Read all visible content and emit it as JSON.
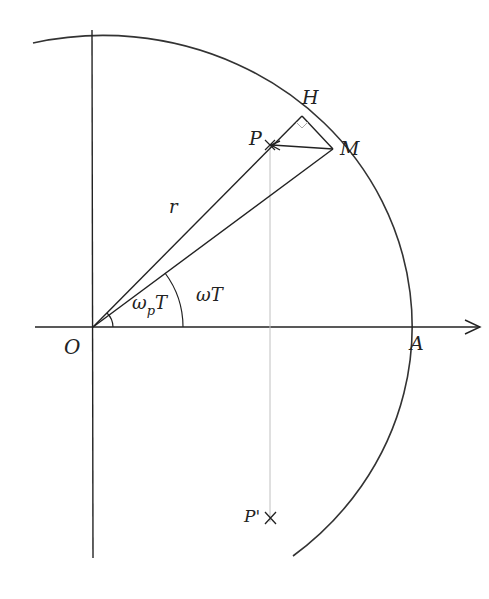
{
  "diagram": {
    "title": "",
    "colors": {
      "stroke": "#2a2a2a",
      "projection": "#bdbdbd",
      "background": "#ffffff"
    },
    "labels": {
      "origin": "O",
      "axis_point": "A",
      "point_p": "P",
      "point_m": "M",
      "point_h": "H",
      "point_p_prime": "P'",
      "radius": "r",
      "angle_p_omega": "ω",
      "angle_p_sub": "p",
      "angle_p_T": "T",
      "angle_m": "ωT"
    },
    "elements": {
      "x_axis": "horizontal axis with arrow",
      "y_axis": "vertical axis",
      "circle_arc": "circular arc centered at O through A",
      "segment_OH": "line from O through P to H",
      "segment_OM": "line from O to M",
      "segment_MP": "arrow from M to P",
      "projection_PP": "thin vertical line from P to P'",
      "right_angle_marker": "at H"
    }
  }
}
